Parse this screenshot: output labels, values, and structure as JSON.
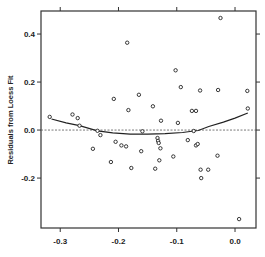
{
  "chart_data": {
    "type": "scatter",
    "title": "",
    "xlabel": "",
    "ylabel": "Residuals from Loess Fit",
    "xlim": [
      -0.333,
      0.036
    ],
    "ylim": [
      -0.408,
      0.496
    ],
    "x_ticks": [
      -0.3,
      -0.2,
      -0.1,
      0.0
    ],
    "x_tick_labels": [
      "-0.3",
      "-0.2",
      "-0.1",
      "0.0"
    ],
    "y_ticks": [
      -0.2,
      0.0,
      0.2,
      0.4
    ],
    "y_tick_labels": [
      "-0.2",
      "0.0",
      "0.2",
      "0.4"
    ],
    "grid": false,
    "legend": null,
    "reference_line": {
      "y": 0.0,
      "style": "dotted"
    },
    "series": [
      {
        "name": "Residuals",
        "kind": "points",
        "marker": "open-circle",
        "points": [
          [
            -0.318,
            0.055
          ],
          [
            -0.279,
            0.065
          ],
          [
            -0.27,
            0.05
          ],
          [
            -0.267,
            0.018
          ],
          [
            -0.236,
            -0.003
          ],
          [
            -0.231,
            -0.021
          ],
          [
            -0.205,
            -0.049
          ],
          [
            -0.244,
            -0.078
          ],
          [
            -0.213,
            -0.133
          ],
          [
            -0.183,
            0.083
          ],
          [
            -0.185,
            0.364
          ],
          [
            -0.141,
            0.099
          ],
          [
            -0.127,
            0.039
          ],
          [
            -0.098,
            0.03
          ],
          [
            -0.159,
            -0.005
          ],
          [
            -0.195,
            -0.064
          ],
          [
            -0.187,
            -0.068
          ],
          [
            -0.133,
            -0.033
          ],
          [
            -0.132,
            -0.045
          ],
          [
            -0.131,
            -0.054
          ],
          [
            -0.128,
            -0.076
          ],
          [
            -0.161,
            -0.088
          ],
          [
            -0.081,
            -0.042
          ],
          [
            -0.106,
            -0.11
          ],
          [
            -0.13,
            -0.126
          ],
          [
            -0.178,
            -0.158
          ],
          [
            -0.137,
            -0.161
          ],
          [
            -0.074,
            0.08
          ],
          [
            -0.067,
            0.08
          ],
          [
            0.022,
            0.09
          ],
          [
            -0.071,
            -0.004
          ],
          [
            -0.067,
            -0.064
          ],
          [
            -0.064,
            -0.058
          ],
          [
            -0.03,
            -0.107
          ],
          [
            -0.059,
            -0.165
          ],
          [
            -0.046,
            -0.165
          ],
          [
            -0.058,
            -0.2
          ],
          [
            -0.102,
            0.249
          ],
          [
            -0.093,
            0.179
          ],
          [
            -0.06,
            0.165
          ],
          [
            -0.029,
            0.167
          ],
          [
            0.021,
            0.163
          ],
          [
            -0.208,
            0.13
          ],
          [
            -0.165,
            0.147
          ],
          [
            -0.025,
            0.467
          ],
          [
            0.007,
            -0.371
          ]
        ]
      },
      {
        "name": "Loess smooth of residuals",
        "kind": "line",
        "points": [
          [
            -0.315,
            0.046
          ],
          [
            -0.29,
            0.03
          ],
          [
            -0.267,
            0.018
          ],
          [
            -0.236,
            -0.003
          ],
          [
            -0.21,
            -0.012
          ],
          [
            -0.18,
            -0.017
          ],
          [
            -0.15,
            -0.017
          ],
          [
            -0.12,
            -0.015
          ],
          [
            -0.09,
            -0.01
          ],
          [
            -0.071,
            -0.004
          ],
          [
            -0.063,
            -0.002
          ],
          [
            -0.045,
            0.015
          ],
          [
            -0.02,
            0.033
          ],
          [
            0.0,
            0.05
          ],
          [
            0.022,
            0.071
          ]
        ]
      }
    ]
  }
}
